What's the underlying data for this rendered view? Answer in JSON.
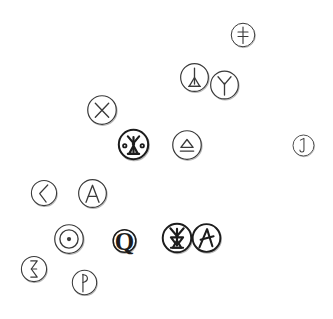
{
  "canvas": {
    "width": 333,
    "height": 319,
    "background": "#ffffff",
    "stroke_color": "#3a3a3a",
    "bold_stroke_color": "#1c1c1c",
    "shadow_color": "#b9b9b9"
  },
  "tokens": [
    {
      "id": "token-double-cross",
      "name": "double-cross-icon",
      "glyph": "double-cross",
      "label": "ǂ",
      "x": 229,
      "y": 16,
      "w": 28,
      "h": 38,
      "bold": false
    },
    {
      "id": "token-triangle-stem",
      "name": "triangle-stem-icon",
      "glyph": "stem-triangle",
      "label": "stem with triangle base",
      "x": 178,
      "y": 59,
      "w": 33,
      "h": 37,
      "bold": false
    },
    {
      "id": "token-psi-y",
      "name": "psi-y-icon",
      "glyph": "psi-y",
      "label": "Ψ",
      "x": 208,
      "y": 66,
      "w": 33,
      "h": 38,
      "bold": false
    },
    {
      "id": "token-x-cross",
      "name": "x-cross-icon",
      "glyph": "x-cross",
      "label": "X",
      "x": 85,
      "y": 92,
      "w": 34,
      "h": 36,
      "bold": false
    },
    {
      "id": "token-dotted-totem",
      "name": "dotted-totem-icon",
      "glyph": "dotted-totem",
      "label": "totem with side dots",
      "x": 116,
      "y": 127,
      "w": 35,
      "h": 35,
      "bold": true
    },
    {
      "id": "token-eject",
      "name": "eject-triangle-icon",
      "glyph": "eject",
      "label": "⏏",
      "x": 170,
      "y": 128,
      "w": 34,
      "h": 34,
      "bold": false
    },
    {
      "id": "token-hook-one",
      "name": "hook-one-icon",
      "glyph": "hook-one",
      "label": "1",
      "x": 291,
      "y": 127,
      "w": 25,
      "h": 37,
      "bold": false
    },
    {
      "id": "token-chevron-left",
      "name": "chevron-left-icon",
      "glyph": "chevron-left",
      "label": "〈",
      "x": 29,
      "y": 174,
      "w": 30,
      "h": 38,
      "bold": false
    },
    {
      "id": "token-letter-a-plain",
      "name": "letter-a-plain-icon",
      "glyph": "letter-a",
      "label": "A",
      "x": 76,
      "y": 176,
      "w": 33,
      "h": 35,
      "bold": false
    },
    {
      "id": "token-circled-dot",
      "name": "circled-dot-icon",
      "glyph": "circled-dot",
      "label": "⊙",
      "x": 52,
      "y": 222,
      "w": 34,
      "h": 34,
      "bold": false
    },
    {
      "id": "token-letter-q",
      "name": "letter-q-icon",
      "glyph": "letter-q",
      "label": "Q",
      "x": 111,
      "y": 221,
      "w": 27,
      "h": 40,
      "bold": true
    },
    {
      "id": "token-hourglass-totem",
      "name": "hourglass-totem-icon",
      "glyph": "hourglass-totem",
      "label": "hourglass totem",
      "x": 160,
      "y": 220,
      "w": 34,
      "h": 36,
      "bold": true
    },
    {
      "id": "token-letter-a-slant",
      "name": "letter-a-slant-icon",
      "glyph": "letter-a-slant",
      "label": "A",
      "x": 190,
      "y": 221,
      "w": 33,
      "h": 34,
      "bold": true
    },
    {
      "id": "token-hourglass",
      "name": "hourglass-icon",
      "glyph": "hourglass",
      "label": "⧖",
      "x": 19,
      "y": 251,
      "w": 30,
      "h": 36,
      "bold": false
    },
    {
      "id": "token-flag-p",
      "name": "flag-p-icon",
      "glyph": "flag-p",
      "label": "P",
      "x": 70,
      "y": 263,
      "w": 29,
      "h": 39,
      "bold": false
    }
  ]
}
